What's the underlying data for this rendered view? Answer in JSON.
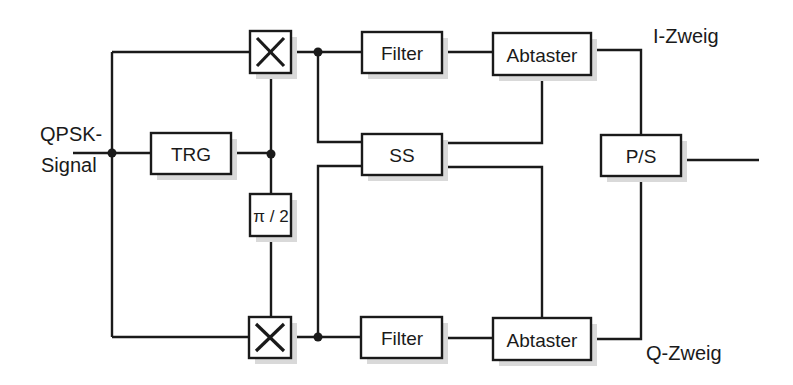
{
  "diagram": {
    "input_label_line1": "QPSK-",
    "input_label_line2": "Signal",
    "blocks": {
      "trg": "TRG",
      "phase_shift": "π / 2",
      "filter_i": "Filter",
      "filter_q": "Filter",
      "sampler_i": "Abtaster",
      "sampler_q": "Abtaster",
      "ss": "SS",
      "ps": "P/S"
    },
    "branch_labels": {
      "i": "I-Zweig",
      "q": "Q-Zweig"
    },
    "mixer_symbol": "×",
    "colors": {
      "line": "#1a1a1a",
      "shadow": "#d9d9d9",
      "background": "#ffffff"
    }
  }
}
